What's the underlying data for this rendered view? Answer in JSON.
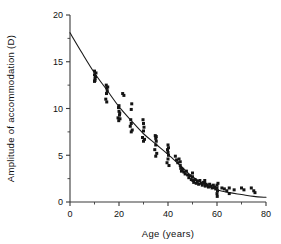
{
  "chart_data": {
    "type": "scatter",
    "title": "",
    "subtitle": "",
    "xlabel": "Age  (years)",
    "ylabel": "Amplitude  of  accommodation  (D)",
    "xlim": [
      0,
      80
    ],
    "ylim": [
      0,
      20
    ],
    "x_ticks_major": [
      0,
      20,
      40,
      60,
      80
    ],
    "x_ticklabels": [
      "0",
      "20",
      "40",
      "60",
      "80"
    ],
    "x_ticks_minor": [
      10,
      30,
      50,
      70
    ],
    "y_ticks_major": [
      0,
      5,
      10,
      15,
      20
    ],
    "y_ticklabels": [
      "0",
      "5",
      "10",
      "15",
      "20"
    ],
    "y_ticks_minor": [
      2.5,
      7.5,
      12.5,
      17.5
    ],
    "grid": false,
    "legend": "none",
    "marker": "filled-square",
    "marker_size_px": 3,
    "series": [
      {
        "name": "Amplitude of accommodation",
        "points": [
          [
            10.0,
            14.0
          ],
          [
            10.0,
            13.6
          ],
          [
            10.2,
            13.2
          ],
          [
            10.4,
            13.4
          ],
          [
            10.0,
            12.9
          ],
          [
            10.6,
            13.8
          ],
          [
            10.2,
            13.0
          ],
          [
            14.8,
            12.5
          ],
          [
            15.0,
            12.2
          ],
          [
            15.2,
            11.9
          ],
          [
            14.6,
            11.0
          ],
          [
            15.0,
            10.7
          ],
          [
            15.4,
            12.3
          ],
          [
            14.9,
            11.6
          ],
          [
            19.8,
            10.1
          ],
          [
            20.0,
            9.7
          ],
          [
            20.2,
            9.3
          ],
          [
            19.6,
            9.0
          ],
          [
            20.4,
            8.9
          ],
          [
            20.0,
            10.3
          ],
          [
            20.3,
            9.5
          ],
          [
            19.9,
            8.7
          ],
          [
            21.5,
            11.6
          ],
          [
            22.0,
            11.4
          ],
          [
            24.8,
            8.8
          ],
          [
            25.0,
            8.4
          ],
          [
            25.2,
            10.5
          ],
          [
            25.0,
            9.9
          ],
          [
            24.6,
            8.1
          ],
          [
            25.4,
            7.7
          ],
          [
            25.0,
            7.5
          ],
          [
            29.8,
            8.8
          ],
          [
            30.0,
            8.4
          ],
          [
            30.2,
            8.0
          ],
          [
            30.0,
            7.6
          ],
          [
            29.6,
            6.9
          ],
          [
            30.4,
            6.7
          ],
          [
            30.0,
            6.5
          ],
          [
            34.8,
            7.1
          ],
          [
            35.0,
            6.8
          ],
          [
            35.2,
            6.5
          ],
          [
            35.0,
            6.1
          ],
          [
            34.6,
            5.6
          ],
          [
            35.4,
            5.2
          ],
          [
            35.0,
            4.9
          ],
          [
            35.2,
            7.0
          ],
          [
            39.8,
            5.6
          ],
          [
            40.0,
            5.3
          ],
          [
            40.2,
            5.0
          ],
          [
            40.0,
            4.6
          ],
          [
            39.6,
            4.2
          ],
          [
            40.4,
            3.9
          ],
          [
            40.0,
            6.1
          ],
          [
            40.2,
            5.8
          ],
          [
            43.0,
            4.9
          ],
          [
            43.5,
            4.5
          ],
          [
            44.0,
            4.2
          ],
          [
            44.5,
            4.6
          ],
          [
            45.0,
            3.9
          ],
          [
            45.2,
            3.6
          ],
          [
            45.5,
            3.3
          ],
          [
            45.0,
            4.3
          ],
          [
            46.0,
            3.5
          ],
          [
            46.5,
            3.2
          ],
          [
            47.0,
            3.0
          ],
          [
            47.5,
            3.3
          ],
          [
            48.0,
            2.9
          ],
          [
            48.5,
            2.6
          ],
          [
            49.0,
            2.8
          ],
          [
            49.5,
            2.4
          ],
          [
            50.0,
            2.7
          ],
          [
            50.2,
            2.3
          ],
          [
            50.5,
            2.1
          ],
          [
            50.0,
            3.1
          ],
          [
            51.0,
            2.4
          ],
          [
            51.5,
            2.0
          ],
          [
            52.0,
            2.2
          ],
          [
            52.5,
            1.9
          ],
          [
            53.0,
            2.3
          ],
          [
            53.5,
            2.0
          ],
          [
            54.0,
            1.8
          ],
          [
            54.5,
            2.1
          ],
          [
            55.0,
            2.0
          ],
          [
            55.2,
            1.7
          ],
          [
            55.5,
            1.9
          ],
          [
            55.0,
            2.3
          ],
          [
            56.0,
            1.8
          ],
          [
            56.5,
            1.6
          ],
          [
            57.0,
            1.9
          ],
          [
            57.5,
            1.7
          ],
          [
            58.0,
            1.5
          ],
          [
            58.5,
            1.8
          ],
          [
            59.0,
            1.6
          ],
          [
            59.5,
            1.4
          ],
          [
            60.0,
            1.8
          ],
          [
            60.0,
            1.5
          ],
          [
            60.2,
            1.2
          ],
          [
            60.0,
            0.9
          ],
          [
            60.4,
            2.0
          ],
          [
            60.1,
            0.6
          ],
          [
            62.0,
            1.5
          ],
          [
            63.0,
            1.4
          ],
          [
            64.0,
            1.2
          ],
          [
            65.0,
            1.5
          ],
          [
            65.0,
            0.9
          ],
          [
            67.0,
            1.3
          ],
          [
            70.0,
            1.5
          ],
          [
            71.0,
            1.3
          ],
          [
            74.0,
            1.5
          ],
          [
            75.0,
            1.2
          ],
          [
            75.5,
            1.0
          ]
        ]
      }
    ],
    "fit_curve": {
      "name": "fitted decay curve",
      "description": "Monotonic decline of accommodative amplitude with age",
      "points": [
        [
          0,
          18.1
        ],
        [
          5,
          15.9
        ],
        [
          10,
          13.8
        ],
        [
          15,
          12.0
        ],
        [
          20,
          10.2
        ],
        [
          25,
          8.7
        ],
        [
          30,
          7.3
        ],
        [
          35,
          6.2
        ],
        [
          40,
          5.1
        ],
        [
          45,
          3.9
        ],
        [
          50,
          2.7
        ],
        [
          55,
          1.9
        ],
        [
          60,
          1.3
        ],
        [
          65,
          1.0
        ],
        [
          70,
          0.8
        ],
        [
          75,
          0.6
        ],
        [
          80,
          0.5
        ]
      ]
    },
    "colors": {
      "marker": "#141414",
      "curve": "#1a1a1a",
      "axis": "#3a3a3a",
      "background": "#ffffff",
      "text": "#111111"
    }
  }
}
